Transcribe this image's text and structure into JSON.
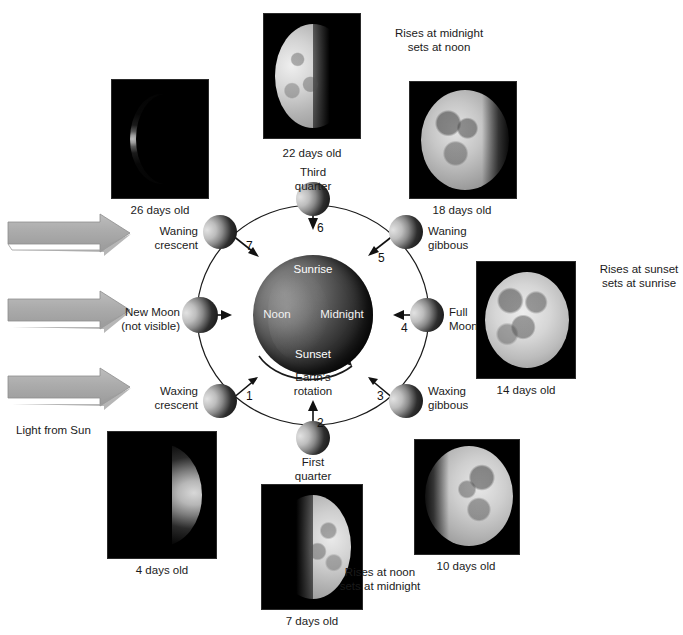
{
  "figure": {
    "light_source_label": "Light from Sun",
    "rotation_label": "Earth's\nrotation"
  },
  "earth": {
    "labels": {
      "sunrise": "Sunrise",
      "noon": "Noon",
      "midnight": "Midnight",
      "sunset": "Sunset"
    }
  },
  "orbit_positions": [
    {
      "number": "1",
      "label": "Waxing\ncrescent",
      "label_side": "left"
    },
    {
      "number": "2",
      "label": "First\nquarter",
      "label_side": "bottom"
    },
    {
      "number": "3",
      "label": "Waxing\ngibbous",
      "label_side": "right"
    },
    {
      "number": "4",
      "label": "Full\nMoon",
      "label_side": "right"
    },
    {
      "number": "5",
      "label": "Waning\ngibbous",
      "label_side": "right"
    },
    {
      "number": "6",
      "label": "Third\nquarter",
      "label_side": "top"
    },
    {
      "number": "7",
      "label": "Waning\ncrescent",
      "label_side": "left"
    },
    {
      "number": "",
      "label": "New Moon\n(not visible)",
      "label_side": "left"
    }
  ],
  "photos": [
    {
      "id": "moon-26",
      "caption": "26 days old"
    },
    {
      "id": "moon-22",
      "caption": "22 days old"
    },
    {
      "id": "moon-18",
      "caption": "18 days old"
    },
    {
      "id": "moon-14",
      "caption": "14 days old"
    },
    {
      "id": "moon-10",
      "caption": "10 days old"
    },
    {
      "id": "moon-7",
      "caption": "7 days old"
    },
    {
      "id": "moon-4",
      "caption": "4 days old"
    }
  ],
  "annotations": {
    "third_quarter_rise_set": "Rises at midnight\nsets at noon",
    "full_moon_rise_set": "Rises at sunset\nsets at sunrise",
    "first_quarter_rise_set": "Rises at noon\nsets at midnight"
  },
  "colors": {
    "sun_arrow": "#a9a9a9",
    "sun_arrow_light": "#c8c8c8",
    "sun_arrow_dark": "#8e8e8e",
    "orbit_line": "#1a1a1a",
    "text": "#1b1b1b",
    "moon_lit": "#f0f0f0",
    "moon_dark": "#111111"
  }
}
